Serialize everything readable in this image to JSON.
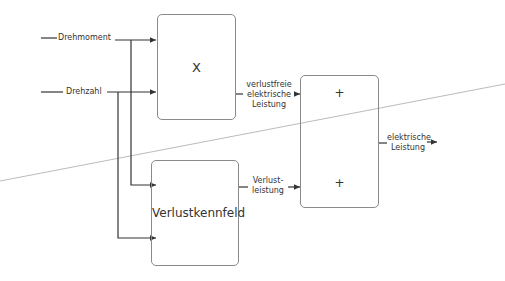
{
  "diagram": {
    "inputs": [
      {
        "label": "Drehmoment"
      },
      {
        "label": "Drehzahl"
      }
    ],
    "blocks": {
      "multiply": {
        "symbol": "X"
      },
      "loss_map": {
        "label": "Verlustkennfeld"
      },
      "sum": {
        "top_sign": "+",
        "bottom_sign": "+"
      }
    },
    "signals": {
      "lossless_power": {
        "line1": "verlustfreie",
        "line2": "elektrische",
        "line3": "Leistung"
      },
      "power_loss": {
        "line1": "Verlust-",
        "line2": "leistung"
      },
      "output_power": {
        "line1": "elektrische",
        "line2": "Leistung"
      }
    },
    "colors": {
      "line": "#333333",
      "block_border": "#8a8a8a",
      "divider": "#aaaaaa"
    }
  }
}
